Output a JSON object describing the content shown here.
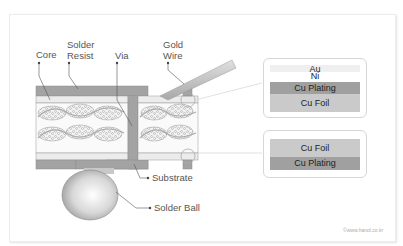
{
  "labels": {
    "core": "Core",
    "solder_resist_line1": "Solder",
    "solder_resist_line2": "Resist",
    "via": "Via",
    "gold_wire_line1": "Gold",
    "gold_wire_line2": "Wire",
    "substrate": "Substrate",
    "solder_ball": "Solder Ball"
  },
  "detail_top": {
    "layers": [
      {
        "label": "Au",
        "color": "#f0f0f0"
      },
      {
        "label": "Ni",
        "color": "#ffffff"
      },
      {
        "label": "Cu Plating",
        "color": "#9a9a9a"
      },
      {
        "label": "Cu Foil",
        "color": "#c8c8c8"
      }
    ]
  },
  "detail_bottom": {
    "layers": [
      {
        "label": "Cu Foil",
        "color": "#c8c8c8"
      },
      {
        "label": "Cu Plating",
        "color": "#9a9a9a"
      }
    ]
  },
  "copyright": "©www.hanol.co.kr",
  "colors": {
    "solder_resist": "#9e9e9e",
    "cu_foil": "#e6e6e6",
    "core_fill": "#ffffff",
    "fiber": "#b5b5b5",
    "outline": "#888888"
  }
}
